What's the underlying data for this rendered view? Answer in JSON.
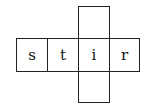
{
  "grid": {
    "row_letters": [
      "s",
      "t",
      "i",
      "r"
    ],
    "column_cells": {
      "above": "",
      "below": ""
    }
  }
}
